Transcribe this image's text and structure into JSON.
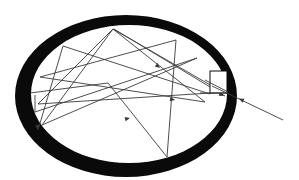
{
  "diagram": {
    "colors": {
      "background": "#ffffff",
      "ring": "#0a0a0a",
      "ray": "#3a3a3a",
      "window": "#ffffff"
    },
    "ring": {
      "outer": {
        "cx": 126,
        "cy": 96,
        "rx": 111,
        "ry": 81
      },
      "inner": {
        "cx": 129,
        "cy": 94,
        "rx": 98,
        "ry": 69
      }
    },
    "window": {
      "x": 210,
      "y": 71,
      "width": 17,
      "height": 22
    },
    "incoming_ray": {
      "x1": 283,
      "y1": 120,
      "x2": 212,
      "y2": 86,
      "arrow_at": [
        242,
        100
      ]
    },
    "ray_segments": [
      [
        212,
        86,
        113,
        29
      ],
      [
        113,
        29,
        38,
        104
      ],
      [
        38,
        104,
        226,
        92
      ],
      [
        113,
        29,
        205,
        102
      ],
      [
        205,
        102,
        40,
        77
      ],
      [
        40,
        77,
        176,
        40
      ],
      [
        176,
        40,
        167,
        157
      ],
      [
        167,
        157,
        108,
        83
      ],
      [
        108,
        83,
        30,
        93
      ],
      [
        113,
        29,
        42,
        125
      ],
      [
        42,
        125,
        197,
        58
      ],
      [
        197,
        58,
        35,
        112
      ],
      [
        35,
        112,
        35,
        95
      ],
      [
        114,
        29,
        225,
        96
      ],
      [
        63,
        46,
        210,
        94
      ],
      [
        63,
        46,
        38,
        130
      ]
    ],
    "arrowheads": [
      [
        38,
        130,
        35,
        109
      ],
      [
        130,
        118,
        95,
        126
      ],
      [
        175,
        100,
        150,
        95
      ],
      [
        160,
        68,
        148,
        58
      ],
      [
        224,
        96,
        216,
        92
      ],
      [
        215,
        12,
        229,
        15
      ]
    ]
  }
}
